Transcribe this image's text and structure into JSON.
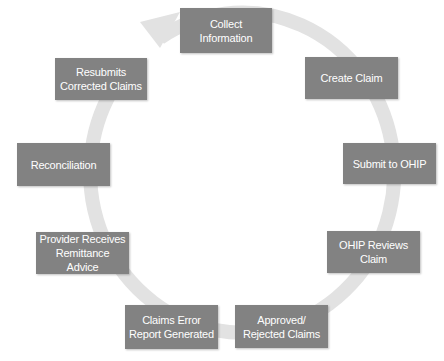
{
  "diagram": {
    "type": "cycle",
    "colors": {
      "box": "#828282",
      "box_text": "#ffffff",
      "ring": "#e2e2e2"
    },
    "steps": [
      {
        "id": "collect",
        "label": "Collect\nInformation"
      },
      {
        "id": "create",
        "label": "Create Claim"
      },
      {
        "id": "submit",
        "label": "Submit to OHIP"
      },
      {
        "id": "review",
        "label": "OHIP Reviews\nClaim"
      },
      {
        "id": "approved",
        "label": "Approved/\nRejected Claims"
      },
      {
        "id": "error",
        "label": "Claims Error\nReport Generated"
      },
      {
        "id": "provider",
        "label": "Provider Receives\nRemittance Advice"
      },
      {
        "id": "reconcile",
        "label": "Reconciliation"
      },
      {
        "id": "resubmit",
        "label": "Resubmits\nCorrected Claims"
      }
    ],
    "flow_direction": "clockwise"
  }
}
